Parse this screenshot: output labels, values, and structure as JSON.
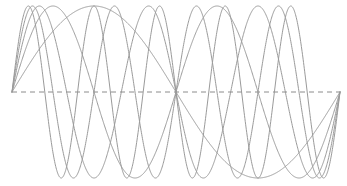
{
  "chart_data": {
    "type": "line",
    "title": "",
    "subtitle": "",
    "xlabel": "",
    "ylabel": "",
    "xlim": [
      0,
      6.283185307179586
    ],
    "ylim": [
      -1,
      1
    ],
    "grid": false,
    "legend": false,
    "legend_position": "none",
    "axes_visible": false,
    "tick_labels_x": [],
    "tick_labels_y": [],
    "annotations": [],
    "background_color": "#ffffff",
    "zero_line": {
      "name": "zero-baseline",
      "value": 0,
      "style": "dashed",
      "color": "#8c8c8c",
      "dash_on": 5,
      "dash_off": 4,
      "width": 1
    },
    "series": [
      {
        "name": "sin(x)",
        "harmonic": 1,
        "amplitude": 1,
        "periods_shown": 1,
        "color": "#9a9a9a",
        "line_width": 1,
        "peaks_x": [
          1.5707963267948966
        ],
        "peaks_y": [
          1
        ],
        "troughs_x": [
          4.71238898038469
        ],
        "troughs_y": [
          -1
        ],
        "zeros_x": [
          0,
          3.141592653589793,
          6.283185307179586
        ]
      },
      {
        "name": "sin(2x)",
        "harmonic": 2,
        "amplitude": 1,
        "periods_shown": 2,
        "color": "#9a9a9a",
        "line_width": 1,
        "peaks_x": [
          0.7853981633974483,
          3.9269908169872414
        ],
        "peaks_y": [
          1,
          1
        ],
        "troughs_x": [
          2.356194490192345,
          5.497787143782138
        ],
        "troughs_y": [
          -1,
          -1
        ],
        "zeros_x": [
          0,
          1.5707963267948966,
          3.141592653589793,
          4.71238898038469,
          6.283185307179586
        ]
      },
      {
        "name": "sin(3x)",
        "harmonic": 3,
        "amplitude": 1,
        "periods_shown": 3,
        "color": "#9a9a9a",
        "line_width": 1,
        "peaks_x": [
          0.5235987755982988,
          2.6179938779914944,
          4.71238898038469
        ],
        "peaks_y": [
          1,
          1,
          1
        ],
        "troughs_x": [
          1.5707963267948966,
          3.6651914291880923,
          5.759586531581287
        ],
        "troughs_y": [
          -1,
          -1,
          -1
        ],
        "zeros_x": [
          0,
          1.0471975511965976,
          2.0943951023931953,
          3.141592653589793,
          4.188790204786391,
          5.235987755982989,
          6.283185307179586
        ]
      },
      {
        "name": "sin(4x)",
        "harmonic": 4,
        "amplitude": 1,
        "periods_shown": 4,
        "color": "#9a9a9a",
        "line_width": 1,
        "peaks_x": [
          0.39269908169872414,
          1.9634954084936207,
          3.5342917352885173,
          5.105088062083414
        ],
        "peaks_y": [
          1,
          1,
          1,
          1
        ],
        "troughs_x": [
          1.1780972450961724,
          2.748893571891069,
          4.319689898685965,
          5.8904862254808625
        ],
        "troughs_y": [
          -1,
          -1,
          -1,
          -1
        ],
        "zeros_x": [
          0,
          0.7853981633974483,
          1.5707963267948966,
          2.356194490192345,
          3.141592653589793,
          3.9269908169872414,
          4.71238898038469,
          5.497787143782138,
          6.283185307179586
        ]
      },
      {
        "name": "sin(5x)",
        "harmonic": 5,
        "amplitude": 1,
        "periods_shown": 5,
        "color": "#9a9a9a",
        "line_width": 1,
        "peaks_x": [
          0.3141592653589793,
          1.5707963267948966,
          2.827433388230814,
          4.084070449666731,
          5.340707511102648
        ],
        "peaks_y": [
          1,
          1,
          1,
          1,
          1
        ],
        "troughs_x": [
          0.9424777960769379,
          2.199114857512855,
          3.4557519189487724,
          4.71238898038469,
          5.969026041820607
        ],
        "troughs_y": [
          -1,
          -1,
          -1,
          -1,
          -1
        ],
        "zeros_x": [
          0,
          0.6283185307179586,
          1.2566370614359172,
          1.8849555921538759,
          2.5132741228718345,
          3.141592653589793,
          3.7699111843077517,
          4.39822971502571,
          5.026548245743669,
          5.654866776461628,
          6.283185307179586
        ]
      }
    ]
  },
  "figure": {
    "name": "harmonic-sine-plot",
    "width": 347,
    "height": 186,
    "plot_left": 12,
    "plot_right": 340,
    "plot_baseline_y": 92,
    "plot_amplitude_px": 86
  }
}
